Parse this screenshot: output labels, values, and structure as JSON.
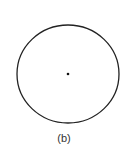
{
  "figure": {
    "label": "(b)",
    "circle": {
      "cx": 68,
      "cy": 74,
      "rx": 51,
      "ry": 49,
      "stroke": "#222222",
      "stroke_width": 1.3
    },
    "center_point": {
      "cx": 68,
      "cy": 74,
      "r": 1.3,
      "fill": "#111111"
    }
  }
}
